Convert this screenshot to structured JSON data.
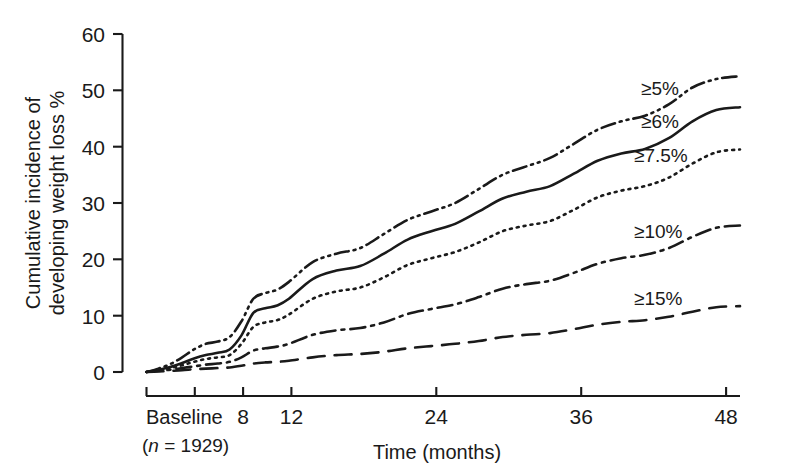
{
  "chart_data": {
    "type": "line",
    "title": "",
    "xlabel": "Time (months)",
    "ylabel": "Cumulative incidence of developing weight loss %",
    "ylabel_line1": "Cumulative incidence of",
    "ylabel_line2": "developing weight loss %",
    "xlim": [
      0,
      50
    ],
    "ylim": [
      0,
      60
    ],
    "y_ticks": [
      0,
      10,
      20,
      30,
      40,
      50,
      60
    ],
    "y_tick_labels": [
      "0",
      "10",
      "20",
      "30",
      "40",
      "50",
      "60"
    ],
    "x_ticks": [
      0,
      4,
      8,
      12,
      24,
      36,
      48
    ],
    "x_tick_labels": [
      "",
      "",
      "8",
      "12",
      "24",
      "36",
      "48"
    ],
    "x_origin_label": "Baseline",
    "x_origin_sublabel_prefix": "(",
    "x_origin_sublabel_italic": "n",
    "x_origin_sublabel_rest": " = 1929)",
    "x_origin_sublabel": "(n = 1929)",
    "grid": false,
    "legend_position": "inline-right",
    "line_color": "#1a1a1a",
    "series": [
      {
        "name": "≥5%",
        "label": "≥5%",
        "style": "dash-dot-dot",
        "dasharray": "14,5,2,5,2,5",
        "label_x": 641,
        "label_y": 95,
        "end_value": 52.5,
        "x": [
          0,
          1,
          2,
          3,
          4,
          5,
          6,
          7,
          8,
          9,
          10,
          11,
          12,
          14,
          16,
          18,
          20,
          22,
          24,
          26,
          28,
          30,
          32,
          34,
          36,
          38,
          40,
          42,
          44,
          46,
          48,
          50
        ],
        "values": [
          0,
          0.6,
          1.4,
          2.6,
          4.0,
          5.0,
          5.4,
          6.2,
          9.0,
          13.0,
          14.0,
          14.6,
          16.0,
          19.5,
          21.0,
          22.0,
          24.5,
          27.0,
          28.5,
          30.0,
          32.5,
          35.0,
          36.5,
          38.0,
          40.5,
          43.0,
          44.5,
          45.5,
          47.5,
          50.5,
          52.0,
          52.5
        ]
      },
      {
        "name": "≥6%",
        "label": "≥6%",
        "style": "solid",
        "dasharray": "",
        "label_x": 641,
        "label_y": 128,
        "end_value": 47.0,
        "x": [
          0,
          1,
          2,
          3,
          4,
          5,
          6,
          7,
          8,
          9,
          10,
          11,
          12,
          14,
          16,
          18,
          20,
          22,
          24,
          26,
          28,
          30,
          32,
          34,
          36,
          38,
          40,
          42,
          44,
          46,
          48,
          50
        ],
        "values": [
          0,
          0.4,
          0.9,
          1.6,
          2.4,
          3.0,
          3.4,
          4.0,
          6.5,
          10.5,
          11.3,
          11.8,
          13.0,
          16.5,
          18.0,
          18.8,
          21.0,
          23.5,
          25.0,
          26.3,
          28.5,
          30.8,
          32.0,
          33.0,
          35.2,
          37.5,
          38.8,
          39.6,
          41.5,
          44.5,
          46.5,
          47.0
        ]
      },
      {
        "name": "≥7.5%",
        "label": "≥7.5%",
        "style": "dotted",
        "dasharray": "2,5",
        "label_x": 634,
        "label_y": 162,
        "end_value": 39.5,
        "x": [
          0,
          1,
          2,
          3,
          4,
          5,
          6,
          7,
          8,
          9,
          10,
          11,
          12,
          14,
          16,
          18,
          20,
          22,
          24,
          26,
          28,
          30,
          32,
          34,
          36,
          38,
          40,
          42,
          44,
          46,
          48,
          50
        ],
        "values": [
          0,
          0.3,
          0.7,
          1.2,
          1.8,
          2.3,
          2.6,
          3.0,
          5.0,
          8.0,
          8.8,
          9.2,
          10.2,
          13.0,
          14.3,
          15.0,
          16.8,
          19.0,
          20.2,
          21.3,
          23.0,
          25.0,
          26.0,
          26.8,
          28.8,
          31.0,
          32.2,
          33.0,
          34.5,
          37.0,
          39.0,
          39.5
        ]
      },
      {
        "name": "≥10%",
        "label": "≥10%",
        "style": "dash-dot",
        "dasharray": "15,6,3,6",
        "label_x": 634,
        "label_y": 238,
        "end_value": 26.0,
        "x": [
          0,
          1,
          2,
          3,
          4,
          5,
          6,
          7,
          8,
          9,
          10,
          11,
          12,
          14,
          16,
          18,
          20,
          22,
          24,
          26,
          28,
          30,
          32,
          34,
          36,
          38,
          40,
          42,
          44,
          46,
          48,
          50
        ],
        "values": [
          0,
          0.2,
          0.4,
          0.7,
          1.0,
          1.3,
          1.5,
          1.8,
          2.6,
          3.8,
          4.2,
          4.5,
          5.0,
          6.6,
          7.4,
          7.8,
          8.8,
          10.3,
          11.2,
          12.0,
          13.3,
          14.8,
          15.6,
          16.2,
          17.6,
          19.2,
          20.2,
          20.8,
          22.0,
          24.0,
          25.6,
          26.0
        ]
      },
      {
        "name": "≥15%",
        "label": "≥15%",
        "style": "dashed",
        "dasharray": "17,10",
        "label_x": 634,
        "label_y": 305,
        "end_value": 11.7,
        "x": [
          0,
          1,
          2,
          3,
          4,
          5,
          6,
          7,
          8,
          9,
          10,
          11,
          12,
          14,
          16,
          18,
          20,
          22,
          24,
          26,
          28,
          30,
          32,
          34,
          36,
          38,
          40,
          42,
          44,
          46,
          48,
          50
        ],
        "values": [
          0,
          0.1,
          0.2,
          0.3,
          0.5,
          0.6,
          0.7,
          0.8,
          1.1,
          1.5,
          1.7,
          1.8,
          2.0,
          2.6,
          3.0,
          3.2,
          3.6,
          4.2,
          4.6,
          5.0,
          5.5,
          6.2,
          6.6,
          6.9,
          7.6,
          8.4,
          8.9,
          9.2,
          9.8,
          10.7,
          11.5,
          11.7
        ]
      }
    ]
  }
}
